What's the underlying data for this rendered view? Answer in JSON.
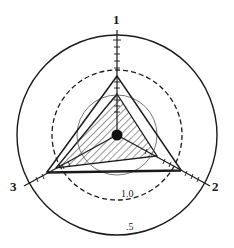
{
  "diagram": {
    "type": "radar-triangle",
    "axes": [
      {
        "id": "1",
        "label": "1"
      },
      {
        "id": "2",
        "label": "2"
      },
      {
        "id": "3",
        "label": "3"
      }
    ],
    "rings": [
      {
        "label": "1.0",
        "style": "dashed"
      },
      {
        "label": ".5",
        "style": "solid"
      }
    ],
    "colors": {
      "stroke": "#1a1a1a",
      "background": "#ffffff"
    }
  }
}
